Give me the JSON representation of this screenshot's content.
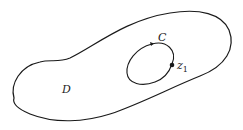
{
  "diagram": {
    "type": "complex-analysis-region",
    "stroke_color": "#1a1a1a",
    "background": "#ffffff",
    "region": {
      "label": "D"
    },
    "contour": {
      "label": "C",
      "orientation": "counterclockwise"
    },
    "point": {
      "label_base": "z",
      "label_sub": "1"
    }
  }
}
